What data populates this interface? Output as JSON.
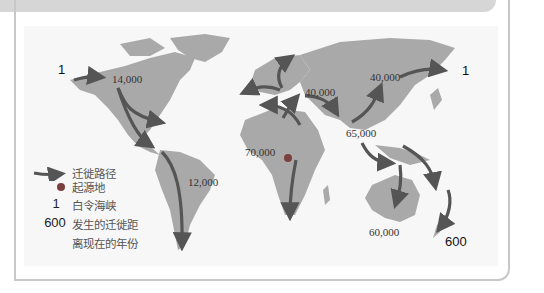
{
  "map": {
    "title": "早期人类迁徙路线图",
    "origin_label": "起源地",
    "route_labels": [
      {
        "id": "alaska-start",
        "text": "1",
        "kind": "bering"
      },
      {
        "id": "north-america",
        "text": "14,000",
        "kind": "years"
      },
      {
        "id": "europe",
        "text": "40,000",
        "kind": "years"
      },
      {
        "id": "siberia",
        "text": "40,000",
        "kind": "years"
      },
      {
        "id": "siberia-end",
        "text": "1",
        "kind": "bering"
      },
      {
        "id": "south-asia",
        "text": "65,000",
        "kind": "years"
      },
      {
        "id": "africa",
        "text": "70,000",
        "kind": "years"
      },
      {
        "id": "south-america",
        "text": "12,000",
        "kind": "years"
      },
      {
        "id": "australia",
        "text": "60,000",
        "kind": "years"
      },
      {
        "id": "new-zealand",
        "text": "600",
        "kind": "years-sans"
      }
    ],
    "colors": {
      "land": "#a9a9a9",
      "arrow": "#555555",
      "background": "#f7f7f7",
      "frame": "#c8c8c8"
    }
  },
  "legend": {
    "items": [
      {
        "key_icon": "arrow-icon",
        "label": "迁徙路径"
      },
      {
        "key_icon": "dot-icon",
        "label": "起源地"
      },
      {
        "key": "1",
        "label": "白令海峡"
      },
      {
        "key": "600",
        "label": "发生的迁徙距"
      },
      {
        "key": "",
        "label": "离现在的年份"
      }
    ]
  }
}
